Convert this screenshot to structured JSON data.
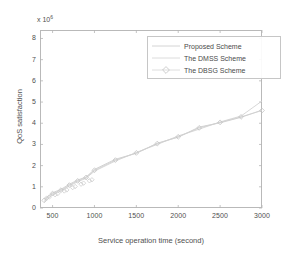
{
  "chart_data": {
    "type": "line",
    "title": "",
    "xlabel": "Service operation time (second)",
    "ylabel": "QoS satisfaction",
    "y_exponent_label": "x 10",
    "y_exponent": "6",
    "xlim": [
      350,
      3000
    ],
    "ylim": [
      0,
      8.4
    ],
    "xticks": [
      500,
      1000,
      1500,
      2000,
      2500,
      3000
    ],
    "yticks": [
      0,
      1,
      2,
      3,
      4,
      5,
      6,
      7,
      8
    ],
    "grid": false,
    "legend_position": "upper-right",
    "series": [
      {
        "name": "Proposed Scheme",
        "marker": "none",
        "color": "#c8c8c8",
        "x": [
          400,
          500,
          600,
          700,
          800,
          900,
          1000,
          1250,
          1500,
          1750,
          2000,
          2250,
          2500,
          2750,
          3000
        ],
        "y": [
          0.42,
          0.72,
          0.88,
          1.12,
          1.32,
          1.46,
          1.82,
          2.3,
          2.58,
          3.06,
          3.34,
          3.82,
          4.02,
          4.28,
          4.62
        ]
      },
      {
        "name": "The DMSS Scheme",
        "marker": "none",
        "color": "#d2d2d2",
        "x": [
          400,
          500,
          600,
          700,
          800,
          900,
          1000,
          1250,
          1500,
          1750,
          2000,
          2250,
          2500,
          2750,
          3000
        ],
        "y": [
          0.3,
          0.62,
          0.8,
          1.04,
          1.24,
          1.4,
          1.74,
          2.22,
          2.62,
          3.0,
          3.4,
          3.72,
          4.06,
          4.34,
          5.05
        ]
      },
      {
        "name": "The DBSG Scheme",
        "marker": "diamond",
        "color": "#cfcfcf",
        "x": [
          400,
          500,
          600,
          700,
          800,
          900,
          1000,
          1250,
          1500,
          1750,
          2000,
          2250,
          2500,
          2750,
          3000
        ],
        "y": [
          0.36,
          0.68,
          0.84,
          1.08,
          1.28,
          1.44,
          1.78,
          2.26,
          2.6,
          3.04,
          3.36,
          3.78,
          4.04,
          4.3,
          4.6
        ]
      }
    ]
  },
  "axes": {
    "y_exponent_text": "x 10",
    "y_exponent_sup": "6",
    "xtick_labels": [
      "500",
      "1000",
      "1500",
      "2000",
      "2500",
      "3000"
    ],
    "ytick_labels": [
      "0",
      "1",
      "2",
      "3",
      "4",
      "5",
      "6",
      "7",
      "8"
    ],
    "xaxis_title": "Service operation time (second)",
    "yaxis_title": "QoS satisfaction"
  },
  "legend": {
    "items": [
      {
        "label": "Proposed Scheme",
        "marker": "line"
      },
      {
        "label": "The DMSS Scheme",
        "marker": "line"
      },
      {
        "label": "The DBSG Scheme",
        "marker": "diamond"
      }
    ]
  }
}
